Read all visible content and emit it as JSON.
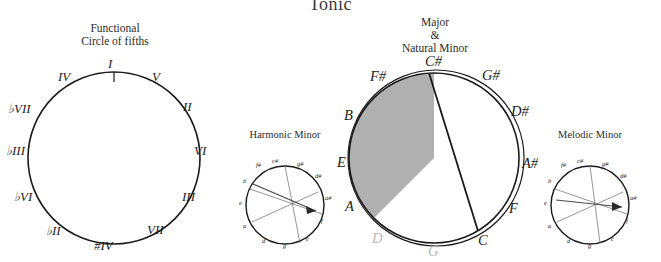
{
  "page": {
    "title": "Tonic"
  },
  "captions": {
    "functional": "Functional\nCircle of fifths",
    "functional_l1": "Functional",
    "functional_l2": "Circle of fifths",
    "major_l1": "Major",
    "major_l2": "&",
    "major_l3": "Natural Minor",
    "harmonic": "Harmonic Minor",
    "melodic": "Melodic Minor"
  },
  "colors": {
    "ring": "#1a1a1a",
    "shaded": "#b0b0b0",
    "gray_text": "#b9b9b9",
    "text": "#1d1d1d"
  },
  "circle_functional": {
    "type": "circle-of-fifths",
    "labels": [
      {
        "name": "I",
        "angle": 0
      },
      {
        "name": "V",
        "angle": 30
      },
      {
        "name": "II",
        "angle": 60
      },
      {
        "name": "VI",
        "angle": 90
      },
      {
        "name": "III",
        "angle": 120
      },
      {
        "name": "VII",
        "angle": 150
      },
      {
        "name": "#IV",
        "angle": 180
      },
      {
        "name": "♭II",
        "angle": 210
      },
      {
        "name": "♭VI",
        "angle": 240
      },
      {
        "name": "♭III",
        "angle": 270
      },
      {
        "name": "♭VII",
        "angle": 300
      },
      {
        "name": "IV",
        "angle": 330
      }
    ],
    "tick_top": "I"
  },
  "circle_major": {
    "type": "circle-of-fifths",
    "labels": [
      {
        "name": "C#",
        "angle": 0,
        "style": "dark"
      },
      {
        "name": "G#",
        "angle": 30,
        "style": "dark"
      },
      {
        "name": "D#",
        "angle": 60,
        "style": "dark"
      },
      {
        "name": "A#",
        "angle": 90,
        "style": "dark"
      },
      {
        "name": "F",
        "angle": 120,
        "style": "dark"
      },
      {
        "name": "C",
        "angle": 150,
        "style": "dark"
      },
      {
        "name": "G",
        "angle": 180,
        "style": "gray"
      },
      {
        "name": "D",
        "angle": 210,
        "style": "gray"
      },
      {
        "name": "A",
        "angle": 240,
        "style": "dark"
      },
      {
        "name": "E",
        "angle": 270,
        "style": "dark"
      },
      {
        "name": "B",
        "angle": 300,
        "style": "dark"
      },
      {
        "name": "F#",
        "angle": 330,
        "style": "dark"
      }
    ],
    "shaded_sector": {
      "from": "C#",
      "to": "A",
      "fill": "#b0b0b0"
    }
  },
  "circle_harmonic": {
    "type": "circle-of-fifths",
    "labels": [
      {
        "name": "c#",
        "angle": 0
      },
      {
        "name": "g#",
        "angle": 30
      },
      {
        "name": "d#",
        "angle": 60
      },
      {
        "name": "a#",
        "angle": 90
      },
      {
        "name": "f",
        "angle": 120
      },
      {
        "name": "c",
        "angle": 150
      },
      {
        "name": "g",
        "angle": 180
      },
      {
        "name": "d",
        "angle": 210
      },
      {
        "name": "a",
        "angle": 240
      },
      {
        "name": "e",
        "angle": 270
      },
      {
        "name": "b",
        "angle": 300
      },
      {
        "name": "f#",
        "angle": 330
      }
    ]
  },
  "circle_melodic": {
    "type": "circle-of-fifths",
    "labels": [
      {
        "name": "c#",
        "angle": 0
      },
      {
        "name": "g#",
        "angle": 30
      },
      {
        "name": "d#",
        "angle": 60
      },
      {
        "name": "a#",
        "angle": 90
      },
      {
        "name": "f",
        "angle": 120
      },
      {
        "name": "c",
        "angle": 150
      },
      {
        "name": "g",
        "angle": 180
      },
      {
        "name": "d",
        "angle": 210
      },
      {
        "name": "a",
        "angle": 240
      },
      {
        "name": "e",
        "angle": 270
      },
      {
        "name": "b",
        "angle": 300
      },
      {
        "name": "f#",
        "angle": 330
      }
    ]
  }
}
